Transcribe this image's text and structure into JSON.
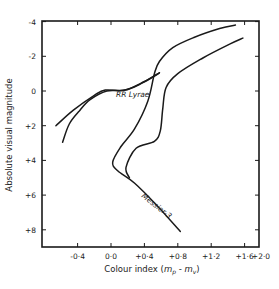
{
  "chart_data": {
    "type": "line",
    "title": "",
    "xlabel": "Colour index (m_p - m_v)",
    "xlabel_parts": {
      "prefix": "Colour index (",
      "m1": "m",
      "s1": "p",
      "dash": " - ",
      "m2": "m",
      "s2": "v",
      "suffix": ")"
    },
    "ylabel": "Absolute visual magnitude",
    "xlim": [
      -0.75,
      1.78
    ],
    "ylim": [
      8.95,
      -4.05
    ],
    "y_inverted": true,
    "grid": false,
    "x_ticks": [
      {
        "value": -0.4,
        "label": "-0·4"
      },
      {
        "value": 0.0,
        "label": "0·0"
      },
      {
        "value": 0.4,
        "label": "+0·4"
      },
      {
        "value": 0.8,
        "label": "+0·8"
      },
      {
        "value": 1.2,
        "label": "+1·2"
      },
      {
        "value": 1.6,
        "label": "+1·6"
      },
      {
        "value": 1.76,
        "label": "+2·0"
      }
    ],
    "y_ticks": [
      {
        "value": -4,
        "label": "-4"
      },
      {
        "value": -2,
        "label": "-2"
      },
      {
        "value": 0,
        "label": "0"
      },
      {
        "value": 2,
        "label": "+2"
      },
      {
        "value": 4,
        "label": "+4"
      },
      {
        "value": 6,
        "label": "+6"
      },
      {
        "value": 8,
        "label": "+8"
      }
    ],
    "series": [
      {
        "name": "Messier-3 (giant branch + main sequence)",
        "points": [
          [
            0.83,
            8.1
          ],
          [
            0.55,
            6.6
          ],
          [
            0.28,
            5.3
          ],
          [
            0.08,
            4.6
          ],
          [
            0.02,
            4.1
          ],
          [
            0.12,
            3.2
          ],
          [
            0.28,
            2.2
          ],
          [
            0.44,
            0.6
          ],
          [
            0.52,
            -1.0
          ],
          [
            0.58,
            -1.7
          ],
          [
            0.74,
            -2.5
          ],
          [
            1.0,
            -3.1
          ],
          [
            1.3,
            -3.6
          ],
          [
            1.49,
            -3.8
          ]
        ]
      },
      {
        "name": "Second branch (right, subgiant/giant)",
        "points": [
          [
            0.22,
            5.0
          ],
          [
            0.18,
            4.4
          ],
          [
            0.3,
            3.3
          ],
          [
            0.52,
            2.9
          ],
          [
            0.59,
            2.3
          ],
          [
            0.62,
            1.0
          ],
          [
            0.66,
            -0.2
          ],
          [
            0.8,
            -1.0
          ],
          [
            1.1,
            -1.9
          ],
          [
            1.42,
            -2.7
          ],
          [
            1.58,
            -3.05
          ]
        ]
      },
      {
        "name": "Horizontal branch (RR Lyrae)",
        "points": [
          [
            -0.66,
            2.0
          ],
          [
            -0.45,
            1.1
          ],
          [
            -0.2,
            0.25
          ],
          [
            -0.07,
            -0.05
          ],
          [
            0.17,
            -0.05
          ],
          [
            0.37,
            -0.45
          ],
          [
            0.55,
            -0.95
          ],
          [
            0.58,
            -1.05
          ]
        ]
      },
      {
        "name": "Asymptotic branch (lower left)",
        "points": [
          [
            -0.58,
            2.95
          ],
          [
            -0.5,
            1.9
          ],
          [
            -0.38,
            1.15
          ],
          [
            -0.25,
            0.5
          ],
          [
            -0.05,
            0.0
          ],
          [
            0.17,
            -0.05
          ],
          [
            0.4,
            -0.55
          ],
          [
            0.58,
            -1.05
          ]
        ]
      }
    ],
    "annotations": [
      {
        "text": "RR Lyrae",
        "x": 0.06,
        "y": 0.35,
        "rotate": 0
      },
      {
        "text": "Messier-3",
        "x": 0.36,
        "y": 6.1,
        "rotate": 38
      }
    ]
  }
}
